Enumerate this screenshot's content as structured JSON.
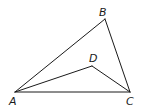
{
  "diagram": {
    "type": "geometry",
    "points": {
      "A": {
        "label": "A",
        "x": 15,
        "y": 92,
        "label_x": 9,
        "label_y": 105
      },
      "B": {
        "label": "B",
        "x": 105,
        "y": 19,
        "label_x": 99,
        "label_y": 16
      },
      "C": {
        "label": "C",
        "x": 130,
        "y": 92,
        "label_x": 126,
        "label_y": 105
      },
      "D": {
        "label": "D",
        "x": 92,
        "y": 66,
        "label_x": 89,
        "label_y": 62
      }
    },
    "segments": [
      {
        "from": "A",
        "to": "B"
      },
      {
        "from": "B",
        "to": "C"
      },
      {
        "from": "A",
        "to": "C"
      },
      {
        "from": "A",
        "to": "D"
      },
      {
        "from": "D",
        "to": "C"
      }
    ],
    "stroke_color": "#1a1a1a",
    "background": "#ffffff"
  }
}
